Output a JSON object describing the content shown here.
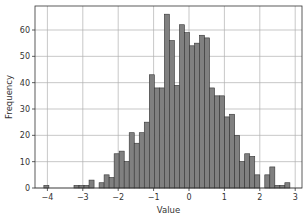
{
  "chart_data": {
    "type": "bar",
    "title": "",
    "xlabel": "Value",
    "ylabel": "Frequency",
    "xlim": [
      -4.3,
      3.15
    ],
    "ylim": [
      0,
      69
    ],
    "grid": true,
    "legend": null,
    "bar_color": "#808080",
    "edge_color": "#333333",
    "xticks": [
      -4,
      -3,
      -2,
      -1,
      0,
      1,
      2,
      3
    ],
    "yticks": [
      0,
      10,
      20,
      30,
      40,
      50,
      60
    ],
    "bin_width": 0.165,
    "bins": [
      {
        "x": -4.08,
        "count": 1
      },
      {
        "x": -3.92,
        "count": 0
      },
      {
        "x": -3.75,
        "count": 0
      },
      {
        "x": -3.59,
        "count": 0
      },
      {
        "x": -3.42,
        "count": 0
      },
      {
        "x": -3.26,
        "count": 0
      },
      {
        "x": -3.09,
        "count": 1
      },
      {
        "x": -2.93,
        "count": 1
      },
      {
        "x": -2.86,
        "count": 1
      },
      {
        "x": -2.76,
        "count": 3
      },
      {
        "x": -2.6,
        "count": 0
      },
      {
        "x": -2.43,
        "count": 2
      },
      {
        "x": -2.27,
        "count": 5
      },
      {
        "x": -2.1,
        "count": 4
      },
      {
        "x": -1.94,
        "count": 13
      },
      {
        "x": -1.78,
        "count": 14
      },
      {
        "x": -1.61,
        "count": 10
      },
      {
        "x": -1.45,
        "count": 21
      },
      {
        "x": -1.28,
        "count": 17
      },
      {
        "x": -1.12,
        "count": 21
      },
      {
        "x": -0.95,
        "count": 25
      },
      {
        "x": -0.79,
        "count": 43
      },
      {
        "x": -0.63,
        "count": 38
      },
      {
        "x": -0.46,
        "count": 38
      },
      {
        "x": -0.3,
        "count": 66
      },
      {
        "x": -0.13,
        "count": 56
      },
      {
        "x": 0.03,
        "count": 39
      },
      {
        "x": 0.2,
        "count": 62
      },
      {
        "x": 0.36,
        "count": 59
      },
      {
        "x": 0.52,
        "count": 54
      },
      {
        "x": 0.69,
        "count": 55
      },
      {
        "x": 0.85,
        "count": 58
      },
      {
        "x": 1.02,
        "count": 57
      },
      {
        "x": 1.18,
        "count": 38
      },
      {
        "x": 1.34,
        "count": 35
      },
      {
        "x": 1.51,
        "count": 35
      },
      {
        "x": 1.67,
        "count": 27
      },
      {
        "x": 1.84,
        "count": 28
      },
      {
        "x": 2.0,
        "count": 20
      },
      {
        "x": 2.16,
        "count": 10
      },
      {
        "x": 2.33,
        "count": 13
      },
      {
        "x": 2.49,
        "count": 12
      },
      {
        "x": 2.66,
        "count": 5
      },
      {
        "x": 2.82,
        "count": 0
      }
    ],
    "tail_bins": [
      {
        "x": 2.98,
        "count": 5
      },
      {
        "x": 3.15,
        "count": 8
      },
      {
        "x": 3.31,
        "count": 1
      },
      {
        "x": 3.47,
        "count": 1
      },
      {
        "x": 3.64,
        "count": 2
      }
    ]
  }
}
